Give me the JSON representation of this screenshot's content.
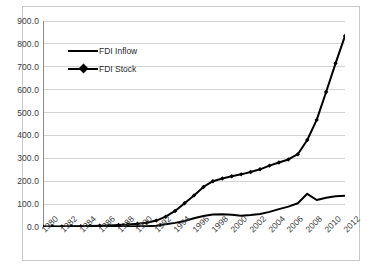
{
  "chart_data": {
    "type": "line",
    "title": "",
    "subtitle": "",
    "xlabel": "",
    "ylabel": "",
    "x": [
      1980,
      1981,
      1982,
      1983,
      1984,
      1985,
      1986,
      1987,
      1988,
      1989,
      1990,
      1991,
      1992,
      1993,
      1994,
      1995,
      1996,
      1997,
      1998,
      1999,
      2000,
      2001,
      2002,
      2003,
      2004,
      2005,
      2006,
      2007,
      2008,
      2009,
      2010,
      2011,
      2012
    ],
    "xlim": [
      1980,
      2012
    ],
    "ylim": [
      0.0,
      900.0
    ],
    "yticks": [
      0.0,
      100.0,
      200.0,
      300.0,
      400.0,
      500.0,
      600.0,
      700.0,
      800.0,
      900.0
    ],
    "ytick_labels": [
      "0.0",
      "100.0",
      "200.0",
      "300.0",
      "400.0",
      "500.0",
      "600.0",
      "700.0",
      "800.0",
      "900.0"
    ],
    "xticks": [
      1980,
      1982,
      1984,
      1986,
      1988,
      1990,
      1992,
      1994,
      1996,
      1998,
      2000,
      2002,
      2004,
      2006,
      2008,
      2010,
      2012
    ],
    "xtick_labels": [
      "1980",
      "1982",
      "1984",
      "1986",
      "1988",
      "1990",
      "1992",
      "1994",
      "1996",
      "1998",
      "2000",
      "2002",
      "2004",
      "2006",
      "2008",
      "2010",
      "2012"
    ],
    "xtick_label_rotation": -45,
    "grid": "horizontal",
    "grid_color": "#c9c9c9",
    "axis_color": "#8a8a8a",
    "background": "#ffffff",
    "legend_position": "upper-left-inside",
    "series": [
      {
        "name": "FDI Inflow",
        "color": "#000000",
        "marker": "none",
        "line_width": 2,
        "values": [
          0.6,
          0.6,
          0.7,
          0.8,
          1.0,
          1.2,
          1.4,
          1.7,
          2.3,
          2.6,
          3.0,
          3.5,
          5.5,
          12.0,
          18.0,
          26.0,
          38.0,
          48.0,
          55.0,
          56.0,
          53.0,
          49.0,
          52.0,
          57.0,
          66.0,
          78.0,
          89.0,
          104.0,
          145.0,
          118.0,
          128.0,
          134.0,
          136.0
        ]
      },
      {
        "name": "FDI Stock",
        "color": "#000000",
        "marker": "diamond",
        "line_width": 2,
        "values": [
          1.5,
          2.0,
          2.5,
          3.0,
          3.5,
          4.5,
          5.5,
          7.0,
          9.0,
          11.0,
          14.0,
          19.0,
          28.0,
          45.0,
          70.0,
          104.0,
          138.0,
          175.0,
          200.0,
          212.0,
          222.0,
          230.0,
          240.0,
          252.0,
          268.0,
          282.0,
          295.0,
          318.0,
          380.0,
          468.0,
          590.0,
          715.0,
          835.0
        ]
      }
    ]
  },
  "legend": {
    "items": [
      {
        "label": "FDI Inflow"
      },
      {
        "label": "FDI Stock"
      }
    ]
  }
}
